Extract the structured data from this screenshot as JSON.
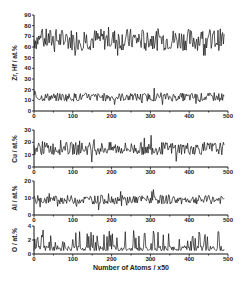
{
  "chart_data": [
    {
      "type": "line",
      "title": "",
      "ylabel": "Zr, Hf / at.%",
      "xlabel": "",
      "xlim": [
        0,
        500
      ],
      "ylim": [
        0,
        90
      ],
      "xticks": [
        0,
        100,
        200,
        300,
        400,
        500
      ],
      "yticks": [
        0,
        10,
        20,
        30,
        40,
        50,
        60,
        70,
        80,
        90
      ],
      "grid": false,
      "series": [
        {
          "name": "Zr",
          "mean": 67,
          "amplitude": 8,
          "min": 52,
          "max": 84
        },
        {
          "name": "Hf",
          "mean": 13,
          "amplitude": 3,
          "min": 6,
          "max": 22
        }
      ]
    },
    {
      "type": "line",
      "ylabel": "Cu / at.%",
      "xlim": [
        0,
        500
      ],
      "ylim": [
        0,
        30
      ],
      "xticks": [
        0,
        100,
        200,
        300,
        400,
        500
      ],
      "yticks": [
        0,
        10,
        20,
        30
      ],
      "grid": false,
      "series": [
        {
          "name": "Cu",
          "mean": 15,
          "amplitude": 4,
          "min": 4,
          "max": 27
        }
      ]
    },
    {
      "type": "line",
      "ylabel": "Al / at.%",
      "xlim": [
        0,
        500
      ],
      "ylim": [
        0,
        20
      ],
      "xticks": [
        0,
        100,
        200,
        300,
        400,
        500
      ],
      "yticks": [
        0,
        10,
        20
      ],
      "grid": false,
      "series": [
        {
          "name": "Al",
          "mean": 9,
          "amplitude": 2,
          "min": 3,
          "max": 15
        }
      ]
    },
    {
      "type": "line",
      "ylabel": "O / at.%",
      "xlabel": "Number of Atoms / x50",
      "xlim": [
        0,
        500
      ],
      "ylim": [
        0,
        4
      ],
      "xticks": [
        0,
        100,
        200,
        300,
        400,
        500
      ],
      "yticks": [
        0,
        2,
        4
      ],
      "grid": false,
      "series": [
        {
          "name": "O",
          "mean": 1,
          "amplitude": 1,
          "min": 0,
          "max": 3.5
        }
      ]
    }
  ],
  "labels": {
    "panel1_ylabel": "Zr, Hf / at.%",
    "panel2_ylabel": "Cu / at.%",
    "panel3_ylabel": "Al / at.%",
    "panel4_ylabel": "O / at.%",
    "xlabel": "Number of Atoms / x50"
  }
}
